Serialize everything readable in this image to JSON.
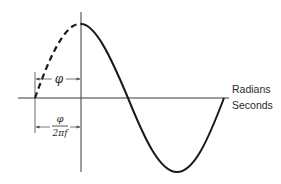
{
  "figure": {
    "type": "phase-shifted sine wave diagram",
    "colors": {
      "line": "#1a1a1a",
      "axis": "#3a3a3a",
      "text": "#2a2a2a",
      "background": "#ffffff"
    }
  },
  "axes": {
    "x_label_top": "Radians",
    "x_label_bottom": "Seconds"
  },
  "annotations": {
    "phase": "φ",
    "time_shift_numerator": "φ",
    "time_shift_denominator": "2πf"
  },
  "curves": {
    "solid": "sine wave starting at peak on vertical axis",
    "dashed": "extension of wave back to zero crossing, offset φ"
  }
}
